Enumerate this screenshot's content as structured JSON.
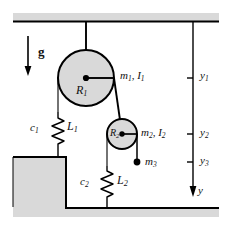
{
  "figure": {
    "background": "#ffffff",
    "fill_gray": "#d9d9d9",
    "line_color": "#000000",
    "width": 232,
    "height": 229
  },
  "labels": {
    "gravity": "g",
    "pulley1_radius": "R",
    "pulley1_radius_sub": "1",
    "pulley2_radius": "R",
    "pulley2_radius_sub": "2",
    "mass1": "m",
    "mass1_sub": "1",
    "inertia1": "I",
    "inertia1_sub": "1",
    "mass1_group": "m₁, I₁",
    "mass2": "m",
    "mass2_sub": "2",
    "inertia2": "I",
    "inertia2_sub": "2",
    "mass2_group": "m₂, I₂",
    "mass3": "m",
    "mass3_sub": "3",
    "damper1": "c",
    "damper1_sub": "1",
    "spring1": "L",
    "spring1_sub": "1",
    "damper2": "c",
    "damper2_sub": "2",
    "spring2": "L",
    "spring2_sub": "2",
    "coord_y1": "y",
    "coord_y1_sub": "1",
    "coord_y2": "y",
    "coord_y2_sub": "2",
    "coord_y3": "y",
    "coord_y3_sub": "3",
    "axis_y": "y",
    "comma": ","
  },
  "geometry": {
    "ceiling_y": 22,
    "ground_y": 208,
    "platform_top_y": 157,
    "platform_right_x": 66,
    "pulley1": {
      "cx": 86,
      "cy": 78,
      "r": 28
    },
    "pulley2": {
      "cx": 122,
      "cy": 134,
      "r": 15
    },
    "mass3_point": {
      "cx": 137,
      "cy": 162,
      "r": 3.2
    },
    "axis_x": 193,
    "tick_y1": 78,
    "tick_y2": 134,
    "tick_y3": 162,
    "axis_arrow_tip_y": 196,
    "gravity_arrow": {
      "x": 28,
      "y_top": 36,
      "y_bottom": 74
    }
  }
}
